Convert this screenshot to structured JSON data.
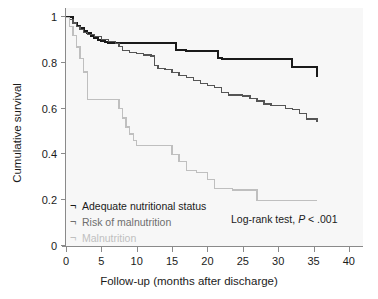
{
  "chart_data": {
    "type": "line",
    "subtype": "kaplan-meier-step",
    "title": "",
    "xlabel": "Follow-up (months after discharge)",
    "ylabel": "Cumulative survival",
    "xlim": [
      0,
      42
    ],
    "ylim": [
      0,
      1.04
    ],
    "xticks": [
      0,
      5,
      10,
      15,
      20,
      25,
      30,
      35,
      40
    ],
    "xtick_labels": [
      "0",
      "5",
      "10",
      "15",
      "20",
      "25",
      "30",
      "35",
      "40"
    ],
    "yticks": [
      0,
      0.2,
      0.4,
      0.6,
      0.8,
      1
    ],
    "ytick_labels": [
      "0",
      "0.2",
      "0.4",
      "0.6",
      "0.8",
      "1"
    ],
    "grid": false,
    "legend_position": "lower-left-inside",
    "annotations": [
      {
        "name": "log-rank-test",
        "text_before": "Log-rank test, ",
        "variable": "P",
        "text_after": " < .001"
      }
    ],
    "series": [
      {
        "name": "Adequate nutritional status",
        "color": "#1a1a1a",
        "width": 2.1,
        "x": [
          0,
          0.5,
          1,
          1.5,
          2,
          2.5,
          3,
          3.5,
          4,
          4.5,
          5,
          5.5,
          6,
          6.5,
          7,
          13,
          15.5,
          17,
          21,
          21.5,
          22,
          29,
          32,
          35.5
        ],
        "y": [
          1.0,
          1.0,
          0.975,
          0.962,
          0.952,
          0.941,
          0.93,
          0.92,
          0.91,
          0.9,
          0.897,
          0.893,
          0.888,
          0.886,
          0.886,
          0.886,
          0.856,
          0.853,
          0.853,
          0.823,
          0.818,
          0.818,
          0.783,
          0.74
        ],
        "final_value": 0.74
      },
      {
        "name": "Risk of malnutrition",
        "color": "#555555",
        "width": 1.3,
        "x": [
          0,
          0.5,
          1,
          1.5,
          2,
          2.5,
          3,
          4,
          5,
          6,
          7,
          7.5,
          8,
          9,
          10,
          11,
          12,
          12.5,
          13,
          14,
          15,
          16,
          17,
          18,
          19,
          20,
          21,
          22,
          23,
          25,
          26,
          27,
          28,
          29,
          30,
          31,
          32,
          33,
          34,
          35.5
        ],
        "y": [
          1.0,
          0.99,
          0.975,
          0.958,
          0.945,
          0.934,
          0.925,
          0.915,
          0.903,
          0.893,
          0.885,
          0.873,
          0.855,
          0.845,
          0.84,
          0.835,
          0.83,
          0.79,
          0.775,
          0.772,
          0.757,
          0.745,
          0.735,
          0.722,
          0.71,
          0.7,
          0.693,
          0.672,
          0.66,
          0.655,
          0.645,
          0.633,
          0.62,
          0.613,
          0.613,
          0.6,
          0.598,
          0.578,
          0.555,
          0.54
        ],
        "final_value": 0.54
      },
      {
        "name": "Malnutrition",
        "color": "#bfbfbf",
        "width": 1.3,
        "x": [
          0,
          0.5,
          1,
          1.5,
          2,
          2.5,
          3,
          7,
          7.5,
          8,
          8.5,
          9,
          9.5,
          10,
          12.5,
          15,
          16,
          17,
          18.5,
          20,
          21,
          23.5,
          27,
          35.5
        ],
        "y": [
          1.0,
          0.96,
          0.92,
          0.87,
          0.82,
          0.76,
          0.64,
          0.64,
          0.6,
          0.56,
          0.52,
          0.49,
          0.46,
          0.44,
          0.44,
          0.4,
          0.37,
          0.33,
          0.32,
          0.29,
          0.25,
          0.245,
          0.2,
          0.2
        ],
        "final_value": 0.2
      }
    ]
  },
  "legend": {
    "marker_glyph": "¬",
    "items": [
      {
        "label": "Adequate nutritional status",
        "color": "#1a1a1a"
      },
      {
        "label": "Risk of malnutrition",
        "color": "#6e6e6e"
      },
      {
        "label": "Malnutrition",
        "color": "#bfbfbf"
      }
    ]
  },
  "style": {
    "panel_background": "#f7f7f7",
    "figure_background": "#ffffff",
    "axis_color": "#8a8a8a",
    "text_color": "#1b1b1b"
  }
}
